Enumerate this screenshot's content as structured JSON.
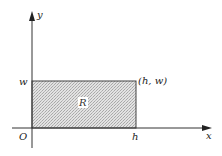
{
  "diagram": {
    "type": "coordinate-plane-rectangle",
    "colors": {
      "axis": "#333333",
      "rect_stroke": "#444444",
      "rect_fill_light": "#e6e6e6",
      "rect_fill_dark": "#b4b4b4",
      "background": "#ffffff"
    },
    "axes": {
      "x_label": "x",
      "y_label": "y",
      "origin_label": "O"
    },
    "ticks": {
      "x_tick_label": "h",
      "y_tick_label": "w"
    },
    "region": {
      "label": "R",
      "corner_label": "(h, w)"
    }
  }
}
